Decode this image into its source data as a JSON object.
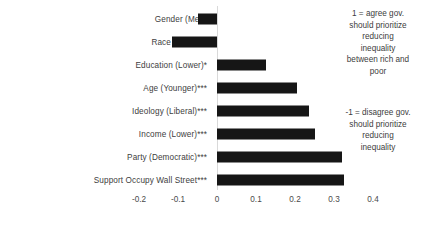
{
  "chart_data": {
    "type": "bar",
    "orientation": "horizontal",
    "title": "",
    "xlabel": "",
    "ylabel": "",
    "xlim": [
      -0.25,
      0.45
    ],
    "grid": false,
    "categories": [
      "Gender (Men)",
      "Race (White)**",
      "Education (Lower)*",
      "Age (Younger)***",
      "Ideology (Liberal)***",
      "Income (Lower)***",
      "Party (Democratic)***",
      "Support Occupy Wall Street***"
    ],
    "values": [
      -0.05,
      -0.115,
      0.125,
      0.205,
      0.235,
      0.25,
      0.32,
      0.325
    ],
    "ticks": [
      "-0.2",
      "-0.1",
      "0",
      "0.1",
      "0.2",
      "0.3",
      "0.4"
    ],
    "tick_values": [
      -0.2,
      -0.1,
      0,
      0.1,
      0.2,
      0.3,
      0.4
    ],
    "bar_color": "#161616",
    "label_color": "#404040"
  },
  "annotations": {
    "positive": [
      "1 = agree gov.",
      "should prioritize",
      "reducing",
      "inequality",
      "between rich and",
      "poor"
    ],
    "negative": [
      "-1 = disagree gov.",
      "should prioritize",
      "reducing",
      "inequality"
    ]
  }
}
